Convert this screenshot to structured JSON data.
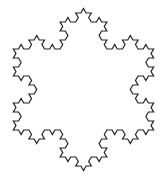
{
  "figure": {
    "name": "koch-snowflake",
    "type": "fractal-outline",
    "iterations": 3,
    "segment_count": 192,
    "orientation": "point-up",
    "tip_count": 6,
    "stroke_color": "#222222",
    "stroke_width": 1.2,
    "fill": "none",
    "background_color": "#ffffff",
    "canvas": {
      "width": 167,
      "height": 178
    },
    "center": {
      "x": 83.5,
      "y": 89.5
    },
    "tip_radius": 81
  }
}
